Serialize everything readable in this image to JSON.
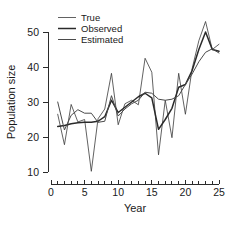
{
  "chart_data": {
    "type": "line",
    "title": "",
    "xlabel": "Year",
    "ylabel": "Population size",
    "xlim": [
      0,
      25
    ],
    "ylim": [
      8,
      54
    ],
    "grid": false,
    "legend_position": "top-left",
    "x_ticks_major": [
      0,
      5,
      10,
      15,
      20,
      25
    ],
    "x_tick_labels": [
      "0",
      "5",
      "10",
      "15",
      "20",
      "25"
    ],
    "x_ticks_minor_step": 1,
    "y_ticks_major": [
      10,
      20,
      30,
      40,
      50
    ],
    "y_tick_labels": [
      "10",
      "20",
      "30",
      "40",
      "50"
    ],
    "x": [
      1,
      2,
      3,
      4,
      5,
      6,
      7,
      8,
      9,
      10,
      11,
      12,
      13,
      14,
      15,
      16,
      17,
      18,
      19,
      20,
      21,
      22,
      23,
      24,
      25
    ],
    "series": [
      {
        "name": "True",
        "color": "#3a3a3a",
        "width": 0.8,
        "values": [
          26.5,
          17.8,
          29.3,
          24.3,
          25.0,
          10.2,
          25.2,
          28.0,
          38.2,
          23.5,
          29.5,
          30.5,
          29.2,
          42.5,
          38.5,
          14.9,
          30.5,
          19.8,
          38.2,
          26.5,
          39.5,
          47.5,
          53.0,
          45.0,
          46.5
        ]
      },
      {
        "name": "Observed",
        "color": "#2a2a2a",
        "width": 1.5,
        "values": [
          23.0,
          23.3,
          23.8,
          24.1,
          24.2,
          24.2,
          24.5,
          25.8,
          30.5,
          27.0,
          28.5,
          30.0,
          31.5,
          32.5,
          31.2,
          22.2,
          25.0,
          28.2,
          34.2,
          35.0,
          39.0,
          45.0,
          50.0,
          45.0,
          44.5
        ]
      },
      {
        "name": "Estimated",
        "color": "#4a4a4a",
        "width": 1.0,
        "values": [
          30.0,
          22.0,
          26.2,
          27.8,
          26.8,
          26.8,
          24.2,
          24.5,
          31.8,
          26.0,
          28.0,
          29.5,
          30.5,
          32.8,
          32.5,
          30.8,
          30.5,
          30.8,
          31.8,
          35.0,
          38.0,
          41.5,
          44.2,
          45.2,
          44.0
        ]
      }
    ],
    "legend_entries": [
      "True",
      "Observed",
      "Estimated"
    ]
  },
  "figure": {
    "background": "#ffffff",
    "axis_color": "#2b2b2b"
  }
}
